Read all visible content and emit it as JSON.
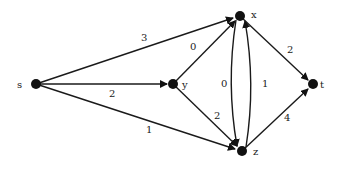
{
  "graph": {
    "nodes": [
      {
        "id": "s",
        "label": "s",
        "x": 36,
        "y": 84
      },
      {
        "id": "y",
        "label": "y",
        "x": 173,
        "y": 84
      },
      {
        "id": "x",
        "label": "x",
        "x": 240,
        "y": 16
      },
      {
        "id": "z",
        "label": "z",
        "x": 242,
        "y": 151
      },
      {
        "id": "t",
        "label": "t",
        "x": 313,
        "y": 84
      }
    ],
    "edges": [
      {
        "from": "s",
        "to": "x",
        "weight": "3"
      },
      {
        "from": "s",
        "to": "y",
        "weight": "2"
      },
      {
        "from": "s",
        "to": "z",
        "weight": "1"
      },
      {
        "from": "y",
        "to": "x",
        "weight": "0"
      },
      {
        "from": "y",
        "to": "z",
        "weight": "2"
      },
      {
        "from": "x",
        "to": "z",
        "weight": "0"
      },
      {
        "from": "z",
        "to": "x",
        "weight": "1"
      },
      {
        "from": "x",
        "to": "t",
        "weight": "2"
      },
      {
        "from": "z",
        "to": "t",
        "weight": "4"
      }
    ]
  },
  "labels": {
    "s": "s",
    "y": "y",
    "x": "x",
    "z": "z",
    "t": "t",
    "w_sx": "3",
    "w_sy": "2",
    "w_sz": "1",
    "w_yx": "0",
    "w_yz": "2",
    "w_xz": "0",
    "w_zx": "1",
    "w_xt": "2",
    "w_zt": "4"
  },
  "colors": {
    "ink": "#111111",
    "background": "#ffffff"
  }
}
